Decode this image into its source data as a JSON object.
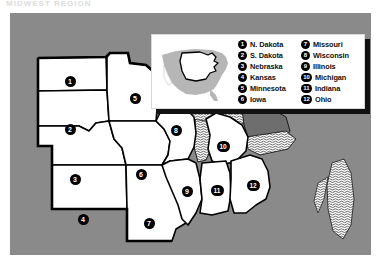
{
  "page": {
    "title_sliver": "MIDWEST REGION",
    "background": "#ffffff"
  },
  "map": {
    "region_name": "Midwest United States",
    "land_color": "#8a8a8a",
    "state_fill": "#ffffff",
    "state_border_color": "#000000",
    "lake_color": "#6e6e6e",
    "water_hatch_color": "#ffffff",
    "badges": [
      {
        "id": "1",
        "state": "N. Dakota",
        "x": 60,
        "y": 68
      },
      {
        "id": "2",
        "state": "S. Dakota",
        "x": 60,
        "y": 116
      },
      {
        "id": "3",
        "state": "Nebraska",
        "x": 65,
        "y": 166
      },
      {
        "id": "4",
        "state": "Kansas",
        "x": 73,
        "y": 206
      },
      {
        "id": "5",
        "state": "Minnesota",
        "x": 125,
        "y": 85
      },
      {
        "id": "6",
        "state": "Iowa",
        "x": 131,
        "y": 161
      },
      {
        "id": "7",
        "state": "Missouri",
        "x": 139,
        "y": 210
      },
      {
        "id": "8",
        "state": "Wisconsin",
        "x": 166,
        "y": 117
      },
      {
        "id": "9",
        "state": "Illinois",
        "x": 177,
        "y": 178
      },
      {
        "id": "10",
        "state": "Michigan",
        "x": 213,
        "y": 133
      },
      {
        "id": "11",
        "state": "Indiana",
        "x": 207,
        "y": 177
      },
      {
        "id": "12",
        "state": "Ohio",
        "x": 243,
        "y": 172
      }
    ]
  },
  "legend": {
    "inset": {
      "name": "us-locator-inset",
      "country_fill": "#b6b6b6",
      "highlight_outline": "#000000",
      "background": "#ffffff"
    },
    "columns": [
      {
        "items": [
          {
            "number": "1",
            "label": "N. Dakota"
          },
          {
            "number": "2",
            "label": "S. Dakota"
          },
          {
            "number": "3",
            "label": "Nebraska"
          },
          {
            "number": "4",
            "label": "Kansas"
          },
          {
            "number": "5",
            "label": "Minnesota"
          },
          {
            "number": "6",
            "label": "Iowa"
          }
        ]
      },
      {
        "items": [
          {
            "number": "7",
            "label": "Missouri"
          },
          {
            "number": "8",
            "label": "Wisconsin"
          },
          {
            "number": "9",
            "label": "Illinois"
          },
          {
            "number": "10",
            "label": "Michigan"
          },
          {
            "number": "11",
            "label": "Indiana"
          },
          {
            "number": "12",
            "label": "Ohio"
          }
        ]
      }
    ]
  }
}
